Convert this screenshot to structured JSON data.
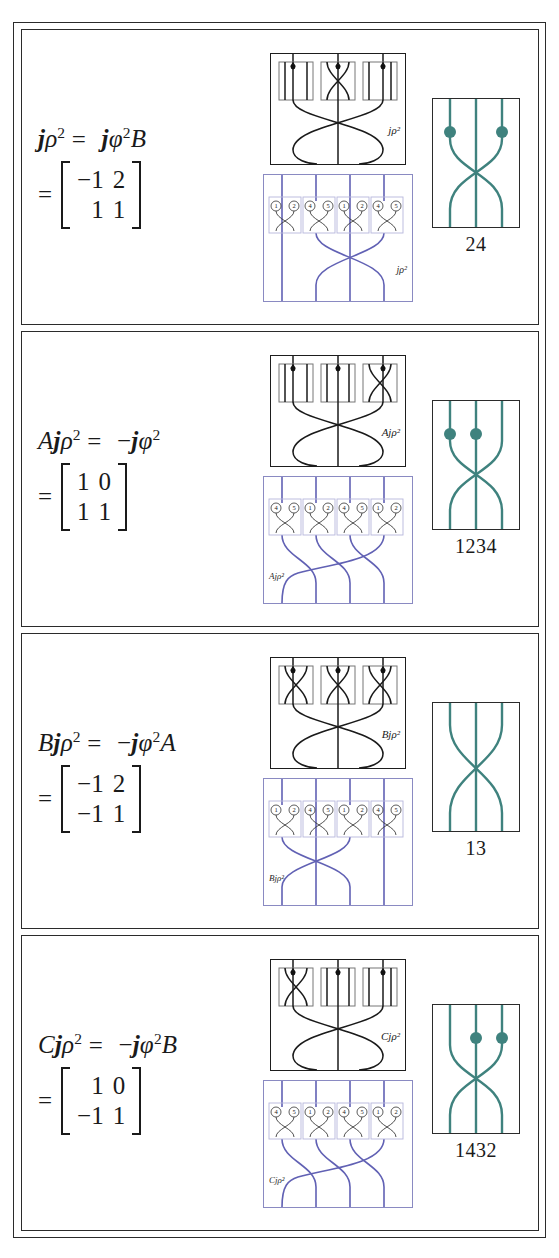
{
  "figure": {
    "type": "math-figure-table",
    "colors": {
      "teal": "#3f827e",
      "blue": "#6161b4",
      "blue_light": "#9a9ad0",
      "ink": "#1a1a1a"
    },
    "panels": [
      {
        "id": "panel-1",
        "equation": {
          "lhs_base": "j",
          "lhs_sym": "ρ",
          "lhs_sup": "2",
          "equals": "=",
          "rhs": "jφ²B",
          "rhs_sign": "",
          "rhs_base": "j",
          "rhs_sym": "φ",
          "rhs_sup": "2",
          "rhs_tail": "B",
          "full": "jρ² = jφ²B"
        },
        "matrix": {
          "rows": [
            [
              "−1",
              "2"
            ],
            [
              "1",
              "1"
            ]
          ]
        },
        "black_diagram": {
          "label": "jρ²",
          "boxes": [
            "vertical-dot",
            "crossing-dot",
            "vertical-dot"
          ]
        },
        "blue_diagram": {
          "label": "jρ²",
          "label_side": "right",
          "gate_numbers": [
            [
              "1",
              "2"
            ],
            [
              "4",
              "5"
            ],
            [
              "1",
              "2"
            ],
            [
              "4",
              "5"
            ]
          ],
          "braid": "single-cross"
        },
        "knot": {
          "caption": "24",
          "dots": [
            "left",
            "right"
          ],
          "strands": 3,
          "crossing": "outer-x"
        }
      },
      {
        "id": "panel-2",
        "equation": {
          "lhs_prefix": "A",
          "lhs_base": "j",
          "lhs_sym": "ρ",
          "lhs_sup": "2",
          "equals": "=",
          "rhs_sign": "−",
          "rhs_base": "j",
          "rhs_sym": "φ",
          "rhs_sup": "2",
          "rhs_tail": "",
          "full": "Ajρ² = −jφ²"
        },
        "matrix": {
          "rows": [
            [
              "1",
              "0"
            ],
            [
              "1",
              "1"
            ]
          ]
        },
        "black_diagram": {
          "label": "Ajρ²",
          "boxes": [
            "vertical-dot",
            "vertical-dot",
            "crossing-dot"
          ]
        },
        "blue_diagram": {
          "label": "Ajρ²",
          "label_side": "left",
          "gate_numbers": [
            [
              "4",
              "5"
            ],
            [
              "1",
              "2"
            ],
            [
              "4",
              "5"
            ],
            [
              "1",
              "2"
            ]
          ],
          "braid": "cascade"
        },
        "knot": {
          "caption": "1234",
          "dots": [
            "left",
            "middle"
          ],
          "strands": 3,
          "crossing": "outer-x"
        }
      },
      {
        "id": "panel-3",
        "equation": {
          "lhs_prefix": "B",
          "lhs_base": "j",
          "lhs_sym": "ρ",
          "lhs_sup": "2",
          "equals": "=",
          "rhs_sign": "−",
          "rhs_base": "j",
          "rhs_sym": "φ",
          "rhs_sup": "2",
          "rhs_tail": "A",
          "full": "Bjρ² = −jφ²A"
        },
        "matrix": {
          "rows": [
            [
              "−1",
              "2"
            ],
            [
              "−1",
              "1"
            ]
          ]
        },
        "black_diagram": {
          "label": "Bjρ²",
          "boxes": [
            "crossing-dot",
            "crossing-dot",
            "crossing-dot"
          ]
        },
        "blue_diagram": {
          "label": "Bjρ²",
          "label_side": "left",
          "gate_numbers": [
            [
              "1",
              "2"
            ],
            [
              "4",
              "5"
            ],
            [
              "1",
              "2"
            ],
            [
              "4",
              "5"
            ]
          ],
          "braid": "left-cross"
        },
        "knot": {
          "caption": "13",
          "dots": [],
          "strands": 3,
          "crossing": "outer-x"
        }
      },
      {
        "id": "panel-4",
        "equation": {
          "lhs_prefix": "C",
          "lhs_base": "j",
          "lhs_sym": "ρ",
          "lhs_sup": "2",
          "equals": "=",
          "rhs_sign": "−",
          "rhs_base": "j",
          "rhs_sym": "φ",
          "rhs_sup": "2",
          "rhs_tail": "B",
          "full": "Cjρ² = −jφ²B"
        },
        "matrix": {
          "rows": [
            [
              "1",
              "0"
            ],
            [
              "−1",
              "1"
            ]
          ]
        },
        "black_diagram": {
          "label": "Cjρ²",
          "boxes": [
            "crossing-dot",
            "vertical-dot",
            "vertical-dot"
          ]
        },
        "blue_diagram": {
          "label": "Cjρ²",
          "label_side": "left",
          "gate_numbers": [
            [
              "4",
              "5"
            ],
            [
              "1",
              "2"
            ],
            [
              "4",
              "5"
            ],
            [
              "1",
              "2"
            ]
          ],
          "braid": "cascade"
        },
        "knot": {
          "caption": "1432",
          "dots": [
            "middle",
            "right"
          ],
          "strands": 3,
          "crossing": "outer-x"
        }
      }
    ]
  }
}
